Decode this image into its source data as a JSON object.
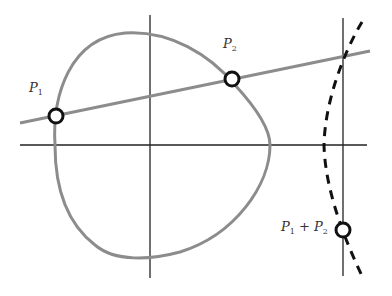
{
  "labels": {
    "p1": {
      "base": "P",
      "sub": "1"
    },
    "p2": {
      "base": "P",
      "sub": "2"
    },
    "sum": {
      "base1": "P",
      "sub1": "1",
      "plus": " + ",
      "base2": "P",
      "sub2": "2"
    }
  },
  "colors": {
    "curve": "#8c8c8c",
    "secant_line": "#8c8c8c",
    "axes": "#222222",
    "reflection_curve": "#111111",
    "point_stroke": "#111111",
    "point_fill": "#ffffff"
  }
}
